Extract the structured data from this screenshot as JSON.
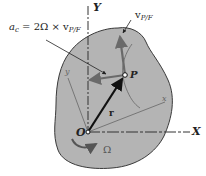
{
  "diagram": {
    "labels": {
      "coriolis_lhs": "a",
      "coriolis_lhs_sub": "c",
      "coriolis_rhs": "= 2Ω × v",
      "coriolis_rhs_sub": "P/F",
      "velocity": "v",
      "velocity_sub": "P/F",
      "axis_Y": "Y",
      "axis_X": "X",
      "point_P": "P",
      "origin_O": "O",
      "position_vector": "r",
      "rotation": "Ω",
      "body_axis_x": "x",
      "body_axis_y": "y"
    },
    "colors": {
      "body_fill": "#b4b4b4",
      "body_stroke": "#3a3a3a",
      "vector_gray": "#707070",
      "position_vector": "#111111",
      "axis": "#333333"
    }
  }
}
